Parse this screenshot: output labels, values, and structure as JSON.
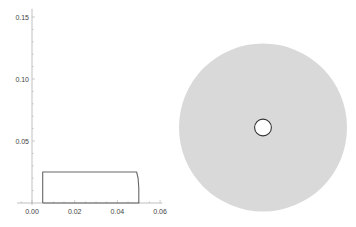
{
  "chart_data": [
    {
      "type": "line",
      "title": "",
      "xlabel": "",
      "ylabel": "",
      "xlim": [
        -0.007,
        0.062
      ],
      "ylim": [
        0,
        0.155
      ],
      "x_ticks": [
        "0.00",
        "0.02",
        "0.04",
        "0.06"
      ],
      "x_tick_values": [
        0.0,
        0.02,
        0.04,
        0.06
      ],
      "y_ticks": [
        "0.05",
        "0.10",
        "0.15"
      ],
      "y_tick_values": [
        0.05,
        0.1,
        0.15
      ],
      "grid": false,
      "legend": null,
      "series": [
        {
          "name": "cross-section profile",
          "color": "#666666",
          "points": [
            [
              0.005,
              0.0
            ],
            [
              0.005,
              0.025
            ],
            [
              0.049,
              0.025
            ],
            [
              0.0497,
              0.02
            ],
            [
              0.05,
              0.012
            ],
            [
              0.05,
              0.0
            ],
            [
              0.005,
              0.0
            ]
          ]
        }
      ]
    },
    {
      "type": "other",
      "description": "Annular disc (top view): filled gray disc with small central hole",
      "outer_radius": 0.05,
      "inner_radius": 0.005,
      "fill_color": "#d9d9d9",
      "hole_edge_color": "#333333"
    }
  ],
  "colors": {
    "axis": "#b0b0b0",
    "profile_line": "#666666",
    "disc_fill": "#d9d9d9",
    "hole_stroke": "#333333"
  }
}
